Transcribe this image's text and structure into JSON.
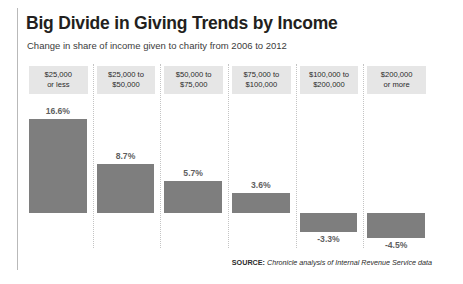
{
  "title": "Big Divide in Giving Trends by Income",
  "subtitle": "Change in share of income given to charity from 2006 to 2012",
  "source": {
    "label": "SOURCE:",
    "text": " Chronicle analysis of Internal Revenue Service data"
  },
  "colors": {
    "bar": "#7e7e7e",
    "header_bg": "#e6e6e6",
    "title": "#231f20",
    "label": "#5f5f5f",
    "separator": "#c4c4c4"
  },
  "chart_data": {
    "type": "bar",
    "title": "Big Divide in Giving Trends by Income",
    "subtitle": "Change in share of income given to charity from 2006 to 2012",
    "xlabel": "",
    "ylabel": "",
    "grid": false,
    "legend": "none",
    "baseline": 0,
    "ylim": [
      -6,
      18
    ],
    "categories": [
      "$25,000 or less",
      "$25,000 to $50,000",
      "$50,000 to $75,000",
      "$75,000 to $100,000",
      "$100,000 to $200,000",
      "$200,000 or more"
    ],
    "category_lines": [
      [
        "$25,000",
        "or less"
      ],
      [
        "$25,000 to",
        "$50,000"
      ],
      [
        "$50,000 to",
        "$75,000"
      ],
      [
        "$75,000 to",
        "$100,000"
      ],
      [
        "$100,000 to",
        "$200,000"
      ],
      [
        "$200,000",
        "or more"
      ]
    ],
    "values": [
      16.6,
      8.7,
      5.7,
      3.6,
      -3.3,
      -4.5
    ],
    "data_labels": [
      "16.6%",
      "8.7%",
      "5.7%",
      "3.6%",
      "-3.3%",
      "-4.5%"
    ]
  }
}
